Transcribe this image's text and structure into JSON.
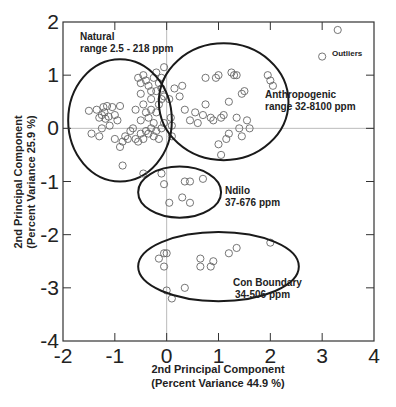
{
  "chart_data": {
    "type": "scatter",
    "title": "",
    "xlabel": "2nd Principal Component (Percent Variance 44.9 %)",
    "ylabel": "2nd Principal Component (Percent Variance 25.9 %)",
    "xlabel_lines": [
      "2nd Principal Component",
      "(Percent Variance 44.9 %)"
    ],
    "ylabel_lines": [
      "2nd Principal Component",
      "(Percent Variance 25.9 %)"
    ],
    "xlim": [
      -2,
      4
    ],
    "ylim": [
      -4,
      2
    ],
    "xticks": [
      -2,
      -1,
      0,
      1,
      2,
      3,
      4
    ],
    "yticks": [
      -4,
      -3,
      -2,
      -1,
      0,
      1,
      2
    ],
    "zero_lines": true,
    "marker": "open-circle",
    "groups": [
      {
        "name": "Natural",
        "label_lines": [
          "Natural",
          "range 2.5 - 218 ppm"
        ],
        "ellipse": {
          "cx": -0.9,
          "cy": 0.15,
          "rx": 1.0,
          "ry": 1.15
        },
        "points": [
          [
            -1.5,
            0.33
          ],
          [
            -1.45,
            -0.1
          ],
          [
            -1.35,
            0.35
          ],
          [
            -1.3,
            0.2
          ],
          [
            -1.25,
            0.25
          ],
          [
            -1.22,
            0.4
          ],
          [
            -1.2,
            0.3
          ],
          [
            -1.18,
            0.18
          ],
          [
            -1.15,
            0.42
          ],
          [
            -1.12,
            0.22
          ],
          [
            -1.1,
            0.05
          ],
          [
            -1.05,
            0.4
          ],
          [
            -1.0,
            0.25
          ],
          [
            -0.95,
            0.15
          ],
          [
            -0.9,
            0.42
          ],
          [
            -1.3,
            -0.15
          ],
          [
            -1.25,
            0.0
          ],
          [
            -1.0,
            -0.2
          ],
          [
            -0.9,
            -0.35
          ],
          [
            -0.85,
            -0.25
          ],
          [
            -0.8,
            -0.15
          ],
          [
            -0.75,
            -0.2
          ],
          [
            -0.7,
            -0.05
          ],
          [
            -0.65,
            0.0
          ],
          [
            -0.6,
            -0.2
          ],
          [
            -0.55,
            -0.25
          ],
          [
            -0.5,
            -0.1
          ],
          [
            -0.45,
            -0.2
          ],
          [
            -0.4,
            -0.05
          ],
          [
            -0.35,
            -0.1
          ],
          [
            -0.3,
            0.0
          ],
          [
            -0.25,
            -0.15
          ],
          [
            -0.2,
            -0.05
          ],
          [
            -0.15,
            -0.2
          ],
          [
            -0.1,
            0.0
          ],
          [
            -0.05,
            0.1
          ],
          [
            -0.85,
            -0.7
          ],
          [
            -0.6,
            0.35
          ],
          [
            -0.5,
            0.15
          ],
          [
            -0.4,
            0.3
          ],
          [
            -0.35,
            0.2
          ],
          [
            -0.3,
            0.35
          ],
          [
            -0.25,
            0.1
          ],
          [
            -0.2,
            0.3
          ],
          [
            -0.15,
            0.45
          ],
          [
            -0.1,
            0.55
          ],
          [
            -0.05,
            0.6
          ],
          [
            -0.55,
            0.95
          ],
          [
            -0.5,
            0.85
          ],
          [
            -0.45,
            1.0
          ],
          [
            -0.4,
            0.9
          ],
          [
            -0.35,
            0.8
          ],
          [
            -0.3,
            0.7
          ],
          [
            -0.25,
            0.95
          ],
          [
            -0.2,
            1.05
          ],
          [
            -0.15,
            0.85
          ],
          [
            -0.1,
            0.75
          ],
          [
            -0.05,
            1.15
          ],
          [
            -0.45,
            0.45
          ],
          [
            -0.5,
            0.65
          ],
          [
            -0.3,
            0.55
          ],
          [
            -0.2,
            0.7
          ],
          [
            -0.1,
            0.95
          ],
          [
            0.05,
            0.55
          ],
          [
            0.08,
            0.2
          ],
          [
            0.1,
            0.05
          ],
          [
            0.1,
            -0.15
          ]
        ]
      },
      {
        "name": "Anthropogenic",
        "label_lines": [
          "Anthropogenic",
          "range 32-8100 ppm"
        ],
        "ellipse": {
          "cx": 1.1,
          "cy": 0.5,
          "rx": 1.25,
          "ry": 1.1
        },
        "points": [
          [
            0.15,
            0.75
          ],
          [
            0.25,
            0.6
          ],
          [
            0.3,
            0.8
          ],
          [
            0.35,
            0.35
          ],
          [
            0.45,
            0.15
          ],
          [
            0.55,
            0.3
          ],
          [
            0.6,
            0.1
          ],
          [
            0.7,
            0.25
          ],
          [
            0.75,
            0.45
          ],
          [
            0.75,
            0.95
          ],
          [
            0.85,
            0.2
          ],
          [
            0.9,
            0.15
          ],
          [
            0.95,
            0.95
          ],
          [
            1.0,
            1.0
          ],
          [
            1.05,
            0.2
          ],
          [
            1.1,
            0.25
          ],
          [
            1.2,
            0.5
          ],
          [
            1.25,
            1.05
          ],
          [
            1.3,
            1.0
          ],
          [
            1.35,
            1.0
          ],
          [
            1.35,
            0.2
          ],
          [
            1.4,
            0.0
          ],
          [
            1.45,
            0.65
          ],
          [
            1.5,
            0.7
          ],
          [
            1.55,
            0.15
          ],
          [
            1.2,
            -0.1
          ],
          [
            1.15,
            -0.2
          ],
          [
            1.05,
            -0.5
          ],
          [
            1.0,
            -0.3
          ],
          [
            1.45,
            -0.15
          ],
          [
            1.6,
            0.0
          ],
          [
            1.95,
            1.0
          ],
          [
            2.0,
            0.9
          ],
          [
            2.05,
            0.8
          ]
        ]
      },
      {
        "name": "Ndilo",
        "label_lines": [
          "Ndilo",
          "37-676 ppm"
        ],
        "ellipse": {
          "cx": 0.25,
          "cy": -1.2,
          "rx": 0.8,
          "ry": 0.48
        },
        "points": [
          [
            -0.45,
            -0.85
          ],
          [
            -0.1,
            -0.85
          ],
          [
            -0.05,
            -1.05
          ],
          [
            0.05,
            -1.4
          ],
          [
            0.3,
            -1.3
          ],
          [
            0.35,
            -1.0
          ],
          [
            0.45,
            -1.0
          ],
          [
            0.45,
            -1.4
          ],
          [
            0.7,
            -0.95
          ]
        ]
      },
      {
        "name": "Con Boundary",
        "label_lines": [
          "Con Boundary",
          "34-506 ppm"
        ],
        "ellipse": {
          "cx": 1.0,
          "cy": -2.6,
          "rx": 1.55,
          "ry": 0.65
        },
        "points": [
          [
            -0.15,
            -2.45
          ],
          [
            -0.05,
            -2.35
          ],
          [
            0.0,
            -2.35
          ],
          [
            -0.05,
            -2.6
          ],
          [
            0.0,
            -3.05
          ],
          [
            0.1,
            -3.2
          ],
          [
            0.35,
            -3.0
          ],
          [
            0.65,
            -2.45
          ],
          [
            0.65,
            -2.6
          ],
          [
            0.85,
            -2.6
          ],
          [
            0.9,
            -2.5
          ],
          [
            1.2,
            -2.35
          ],
          [
            1.35,
            -2.25
          ],
          [
            2.0,
            -2.15
          ]
        ]
      },
      {
        "name": "Outliers",
        "label_lines": [
          "Outliers"
        ],
        "ellipse": null,
        "points": [
          [
            3.3,
            1.85
          ],
          [
            3.0,
            1.35
          ]
        ]
      }
    ]
  },
  "style": {
    "axis_color": "#333333",
    "ellipse_color": "#1a1a1a",
    "marker_color": "#666666",
    "zero_line_color": "#bbbbbb"
  }
}
